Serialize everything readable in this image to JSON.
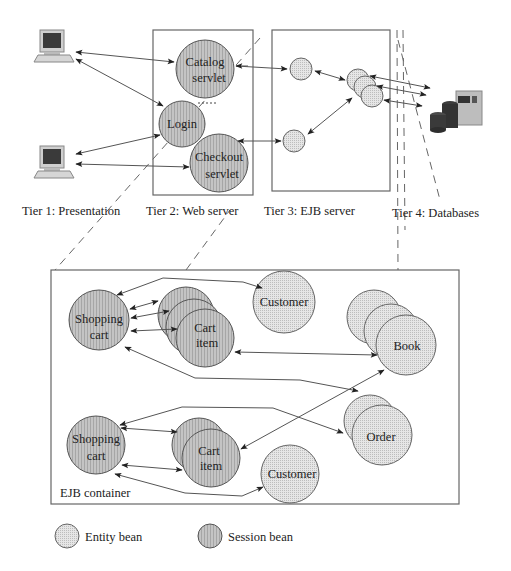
{
  "tiers": [
    {
      "label": "Tier 1: Presentation"
    },
    {
      "label": "Tier 2: Web server"
    },
    {
      "label": "Tier 3: EJB server"
    },
    {
      "label": "Tier 4: Databases"
    }
  ],
  "web_server": {
    "catalog": {
      "line1": "Catalog",
      "line2": "servlet"
    },
    "login": {
      "label": "Login"
    },
    "checkout": {
      "line1": "Checkout",
      "line2": "servlet"
    }
  },
  "container": {
    "label": "EJB container",
    "group1": {
      "shopping_cart": {
        "line1": "Shopping",
        "line2": "cart"
      },
      "cart_item": {
        "line1": "Cart",
        "line2": "item"
      },
      "customer": {
        "label": "Customer"
      }
    },
    "group2": {
      "shopping_cart": {
        "line1": "Shopping",
        "line2": "cart"
      },
      "cart_item": {
        "line1": "Cart",
        "line2": "item"
      },
      "customer": {
        "label": "Customer"
      }
    },
    "book": {
      "label": "Book"
    },
    "order": {
      "label": "Order"
    }
  },
  "legend": {
    "entity": "Entity bean",
    "session": "Session bean"
  },
  "colors": {
    "session_fill": "#b8b8b8",
    "entity_fill": "#dcdcdc",
    "line": "#555555"
  }
}
